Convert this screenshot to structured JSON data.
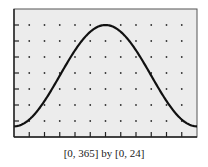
{
  "chart_data": {
    "type": "line",
    "title": "",
    "caption": "[0, 365] by [0, 24]",
    "xlabel": "",
    "ylabel": "",
    "xlim": [
      0,
      365
    ],
    "ylim": [
      0,
      24
    ],
    "x_tick_step": 30.4167,
    "y_tick_step": 3,
    "grid": "dots",
    "legend": null,
    "series": [
      {
        "name": "curve",
        "x": [
          0,
          30,
          60,
          91,
          121,
          152,
          182.5,
          213,
          243,
          274,
          304,
          335,
          365
        ],
        "y": [
          2.0,
          3.3,
          6.6,
          11.4,
          16.3,
          20.0,
          21.0,
          20.0,
          16.6,
          11.6,
          6.7,
          3.2,
          2.0
        ]
      }
    ]
  },
  "colors": {
    "background": "#ececec",
    "frame": "#333333",
    "curve": "#111111",
    "dots": "#333333"
  }
}
